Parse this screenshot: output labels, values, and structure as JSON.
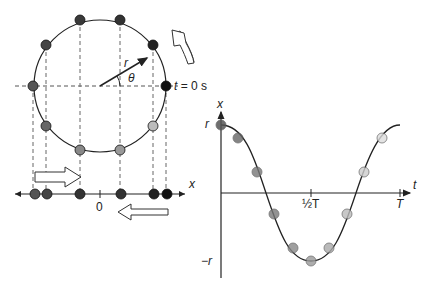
{
  "diagram": {
    "circle": {
      "radius_label": "r",
      "angle_label": "θ",
      "start_label": "t = 0 s",
      "dot_count": 10
    },
    "x_axis": {
      "label": "x",
      "origin_label": "0"
    },
    "graph": {
      "y_label": "x",
      "x_label": "t",
      "y_max_label": "r",
      "y_min_label": "−r",
      "half_period_label": "½T",
      "period_label": "T"
    },
    "colors": {
      "line": "#222222",
      "dash": "#555555",
      "dot_dark": "#222222",
      "dot_mid": "#555555",
      "dot_light": "#aaaaaa"
    }
  }
}
